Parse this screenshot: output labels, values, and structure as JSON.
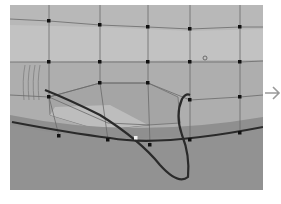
{
  "viewport": {
    "label": "3D surface viewport",
    "colors": {
      "background": "#9c9c9c",
      "surface_upper": "#b9b9b9",
      "surface_band": "#c4c4c4",
      "surface_lower": "#a9a9a9",
      "patch": "#a3a3a3",
      "patch_light": "#bdbdbd",
      "edge_strip": "#8f8f8f",
      "ground": "#929292",
      "grid_line": "#6e6e6e",
      "control_point": "#111111",
      "curve": "#2a2a2a",
      "selected_point": "#f2f2f2"
    },
    "control_points": [
      [
        39,
        16
      ],
      [
        90,
        20
      ],
      [
        138,
        22
      ],
      [
        180,
        24
      ],
      [
        230,
        22
      ],
      [
        39,
        57
      ],
      [
        90,
        57
      ],
      [
        138,
        57
      ],
      [
        180,
        57
      ],
      [
        230,
        57
      ],
      [
        39,
        92
      ],
      [
        90,
        78
      ],
      [
        138,
        78
      ],
      [
        180,
        95
      ],
      [
        230,
        92
      ],
      [
        49,
        131
      ],
      [
        98,
        135
      ],
      [
        140,
        140
      ],
      [
        180,
        135
      ],
      [
        230,
        128
      ]
    ],
    "selected_point": [
      126,
      133
    ]
  },
  "side_arrow": {
    "icon": "arrow-right-icon",
    "color": "#9a9a9a"
  }
}
